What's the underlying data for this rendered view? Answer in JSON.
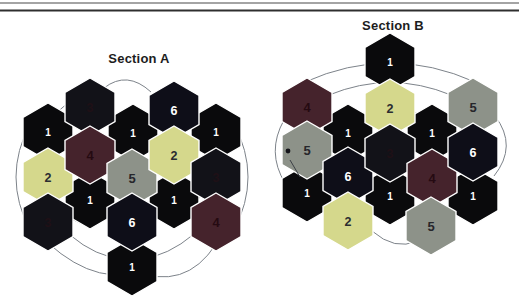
{
  "page": {
    "width": 519,
    "height": 303,
    "background": "#ffffff"
  },
  "header_rules": {
    "color_top": "#4a4a4a",
    "color_bottom": "#2e2e2e"
  },
  "hex_style": {
    "width": 50,
    "height": 58,
    "stroke": "#ffffff",
    "stroke_width": 1.4,
    "arc_color": "#7d838a"
  },
  "palette": {
    "1": {
      "fill": "#0a0a0c",
      "text": "#ffffff",
      "font_size": 10
    },
    "2": {
      "fill": "#d5d88c",
      "text": "#2b2d31",
      "font_size": 12.5
    },
    "3": {
      "fill": "#121218",
      "text": "#1f1016",
      "font_size": 12.5
    },
    "4": {
      "fill": "#45232c",
      "text": "#250a12",
      "font_size": 13
    },
    "5": {
      "fill": "#8d9289",
      "text": "#26262b",
      "font_size": 13
    },
    "6": {
      "fill": "#0e0e18",
      "text": "#ffffff",
      "font_size": 12.5
    }
  },
  "sections": [
    {
      "title": "Section A",
      "hexes": [
        {
          "x": 48,
          "y": 132,
          "n": "1"
        },
        {
          "x": 133,
          "y": 133,
          "n": "1"
        },
        {
          "x": 216,
          "y": 132,
          "n": "1"
        },
        {
          "x": 90,
          "y": 200,
          "n": "1"
        },
        {
          "x": 174,
          "y": 200,
          "n": "1"
        },
        {
          "x": 132,
          "y": 267,
          "n": "1"
        },
        {
          "x": 48,
          "y": 177,
          "n": "2"
        },
        {
          "x": 48,
          "y": 222,
          "n": "3"
        },
        {
          "x": 90,
          "y": 107,
          "n": "3"
        },
        {
          "x": 90,
          "y": 155,
          "n": "4"
        },
        {
          "x": 132,
          "y": 178,
          "n": "5"
        },
        {
          "x": 132,
          "y": 222,
          "n": "6"
        },
        {
          "x": 174,
          "y": 110,
          "n": "6"
        },
        {
          "x": 174,
          "y": 155,
          "n": "2"
        },
        {
          "x": 216,
          "y": 177,
          "n": "3"
        },
        {
          "x": 216,
          "y": 222,
          "n": "4"
        }
      ],
      "arcs": [
        "M104,88 Q127,70 151,92",
        "M54,120 Q58,108 71,102",
        "M115,117 Q125,123 128,132",
        "M198,114 Q208,110 214,124",
        "M150,134 Q157,139 162,146",
        "M30,124 Q2,177 30,230",
        "M234,124 Q262,177 234,230",
        "M58,210 Q68,219 80,223",
        "M183,211 Q193,207 200,197",
        "M70,235 Q96,257 123,259",
        "M48,243 Q100,290 150,268",
        "M141,259 Q168,256 194,234",
        "M132,270 Q185,292 216,244"
      ],
      "marks": []
    },
    {
      "title": "Section B",
      "hexes": [
        {
          "x": 390,
          "y": 62,
          "n": "1"
        },
        {
          "x": 348,
          "y": 133,
          "n": "1"
        },
        {
          "x": 432,
          "y": 133,
          "n": "1"
        },
        {
          "x": 307,
          "y": 193,
          "n": "1"
        },
        {
          "x": 390,
          "y": 196,
          "n": "1"
        },
        {
          "x": 473,
          "y": 196,
          "n": "1"
        },
        {
          "x": 307,
          "y": 107,
          "n": "4"
        },
        {
          "x": 307,
          "y": 150,
          "n": "5"
        },
        {
          "x": 348,
          "y": 176,
          "n": "6"
        },
        {
          "x": 348,
          "y": 221,
          "n": "2"
        },
        {
          "x": 390,
          "y": 108,
          "n": "2"
        },
        {
          "x": 390,
          "y": 153,
          "n": "3"
        },
        {
          "x": 432,
          "y": 178,
          "n": "4"
        },
        {
          "x": 431,
          "y": 226,
          "n": "5"
        },
        {
          "x": 473,
          "y": 107,
          "n": "5"
        },
        {
          "x": 473,
          "y": 152,
          "n": "6"
        }
      ],
      "arcs": [
        "M305,82 Q390,44 475,82",
        "M329,95 Q390,70 451,95",
        "M326,112 Q337,118 344,124",
        "M359,120 Q366,114 371,109",
        "M409,109 Q418,113 425,120",
        "M452,122 Q459,114 467,109",
        "M284,120 Q266,152 285,183",
        "M495,116 Q518,146 494,176",
        "M317,207 Q327,216 335,220",
        "M383,218 Q374,214 368,206",
        "M372,231 Q395,251 417,241",
        "M397,206 Q405,211 412,214",
        "M459,209 Q455,220 448,227"
      ],
      "marks": [
        {
          "type": "dot",
          "x": 288,
          "y": 151,
          "r": 2.4
        },
        {
          "type": "line",
          "x1": 290,
          "y1": 160,
          "x2": 300,
          "y2": 177
        }
      ]
    }
  ]
}
